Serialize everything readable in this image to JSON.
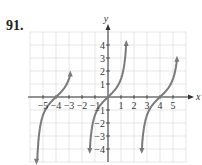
{
  "problem_number": "91.",
  "chart_data": {
    "type": "line",
    "title": "",
    "xlabel": "x",
    "ylabel": "y",
    "xlim": [
      -6,
      6
    ],
    "ylim": [
      -5,
      5
    ],
    "x_ticks": [
      "-5",
      "-4",
      "-3",
      "-2",
      "-1",
      "1",
      "2",
      "3",
      "4",
      "5"
    ],
    "y_ticks": [
      "4",
      "3",
      "2",
      "1",
      "-1",
      "-2",
      "-3",
      "-4"
    ],
    "grid": true,
    "series": [
      {
        "name": "tan-like branch left",
        "x_range": [
          -5.5,
          -2.9
        ],
        "zero": -4,
        "asymptotes": [
          -5.57,
          -2.43
        ]
      },
      {
        "name": "tan-like branch center",
        "x_range": [
          -1.4,
          1.4
        ],
        "zero": 0,
        "asymptotes": [
          -1.57,
          1.57
        ]
      },
      {
        "name": "tan-like branch right",
        "x_range": [
          2.6,
          5.3
        ],
        "zero": 4,
        "asymptotes": [
          2.43,
          5.57
        ]
      }
    ],
    "curve_color": "#7a7a7a"
  }
}
